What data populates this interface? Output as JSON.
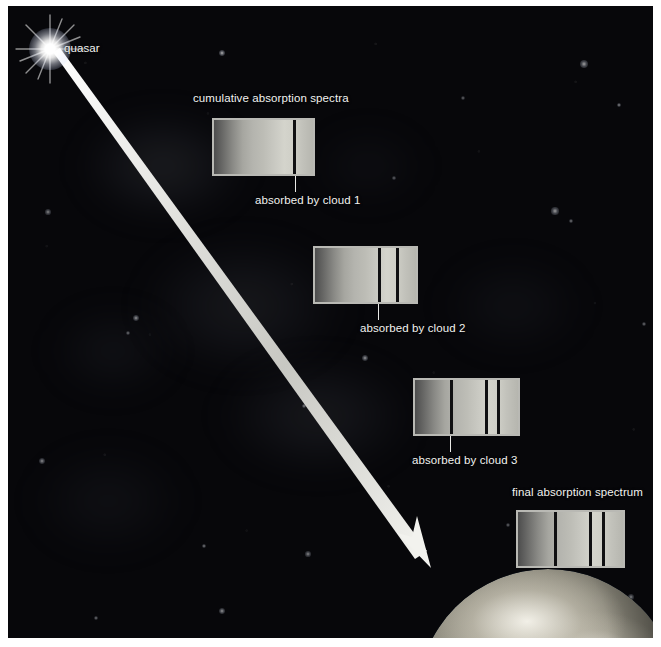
{
  "figure": {
    "title_label": "cumulative absorption spectra",
    "quasar_label": "quasar",
    "final_label": "final absorption spectrum",
    "background_color": "#07070a",
    "beam_color": "#e8e8e4",
    "label_color": "#f2f2f0",
    "spectrum_border_color": "#b9b9b4",
    "absorption_line_color": "#101012"
  },
  "spectra": [
    {
      "id": "spectrum-cloud-1",
      "label": "absorbed by cloud 1",
      "line_count": 1,
      "lines_pct": [
        80
      ],
      "x": 204,
      "y": 112,
      "w": 103,
      "h": 58,
      "leader_x": 287,
      "leader_top": 170,
      "leader_bottom": 186,
      "label_x": 247,
      "label_y": 188
    },
    {
      "id": "spectrum-cloud-2",
      "label": "absorbed by cloud 2",
      "line_count": 2,
      "lines_pct": [
        62,
        80
      ],
      "x": 305,
      "y": 240,
      "w": 105,
      "h": 58,
      "leader_x": 370,
      "leader_top": 298,
      "leader_bottom": 314,
      "label_x": 352,
      "label_y": 316
    },
    {
      "id": "spectrum-cloud-3",
      "label": "absorbed by cloud 3",
      "line_count": 3,
      "lines_pct": [
        34,
        68,
        80
      ],
      "x": 405,
      "y": 372,
      "w": 107,
      "h": 58,
      "leader_x": 442,
      "leader_top": 430,
      "leader_bottom": 446,
      "label_x": 404,
      "label_y": 448
    },
    {
      "id": "spectrum-final",
      "label": "",
      "line_count": 3,
      "lines_pct": [
        34,
        68,
        80
      ],
      "x": 508,
      "y": 504,
      "w": 109,
      "h": 58,
      "leader_x": 0,
      "leader_top": 0,
      "leader_bottom": 0,
      "label_x": 0,
      "label_y": 0
    }
  ],
  "nebulae": [
    {
      "x": 70,
      "y": 105,
      "w": 170,
      "h": 110,
      "color": "rgba(118,124,138,0.20)"
    },
    {
      "x": 130,
      "y": 230,
      "w": 210,
      "h": 140,
      "color": "rgba(112,118,132,0.17)"
    },
    {
      "x": 210,
      "y": 350,
      "w": 200,
      "h": 120,
      "color": "rgba(120,126,140,0.16)"
    },
    {
      "x": 40,
      "y": 300,
      "w": 130,
      "h": 90,
      "color": "rgba(100,106,120,0.12)"
    },
    {
      "x": 300,
      "y": 120,
      "w": 120,
      "h": 80,
      "color": "rgba(100,106,120,0.09)"
    },
    {
      "x": 430,
      "y": 250,
      "w": 150,
      "h": 100,
      "color": "rgba(104,110,124,0.10)"
    },
    {
      "x": 20,
      "y": 440,
      "w": 160,
      "h": 110,
      "color": "rgba(104,110,124,0.10)"
    }
  ],
  "stars": [
    {
      "x": 214,
      "y": 47,
      "r": 3.0,
      "o": 0.7
    },
    {
      "x": 576,
      "y": 58,
      "r": 4.0,
      "o": 0.62
    },
    {
      "x": 611,
      "y": 99,
      "r": 2.4,
      "o": 0.55
    },
    {
      "x": 547,
      "y": 205,
      "r": 3.6,
      "o": 0.6
    },
    {
      "x": 563,
      "y": 215,
      "r": 2.2,
      "o": 0.48
    },
    {
      "x": 40,
      "y": 206,
      "r": 2.6,
      "o": 0.52
    },
    {
      "x": 128,
      "y": 312,
      "r": 3.0,
      "o": 0.58
    },
    {
      "x": 120,
      "y": 327,
      "r": 2.0,
      "o": 0.45
    },
    {
      "x": 357,
      "y": 352,
      "r": 3.4,
      "o": 0.6
    },
    {
      "x": 296,
      "y": 400,
      "r": 2.2,
      "o": 0.5
    },
    {
      "x": 34,
      "y": 455,
      "r": 3.2,
      "o": 0.55
    },
    {
      "x": 196,
      "y": 540,
      "r": 2.4,
      "o": 0.5
    },
    {
      "x": 300,
      "y": 548,
      "r": 2.6,
      "o": 0.52
    },
    {
      "x": 500,
      "y": 519,
      "r": 2.0,
      "o": 0.42
    },
    {
      "x": 214,
      "y": 605,
      "r": 3.0,
      "o": 0.58
    },
    {
      "x": 623,
      "y": 591,
      "r": 2.6,
      "o": 0.5
    },
    {
      "x": 636,
      "y": 318,
      "r": 2.2,
      "o": 0.45
    },
    {
      "x": 455,
      "y": 92,
      "r": 2.0,
      "o": 0.42
    },
    {
      "x": 88,
      "y": 612,
      "r": 2.2,
      "o": 0.46
    },
    {
      "x": 386,
      "y": 172,
      "r": 1.8,
      "o": 0.4
    }
  ],
  "beam": {
    "start_x": 48,
    "start_y": 50,
    "tip_x": 423,
    "tip_y": 562
  }
}
